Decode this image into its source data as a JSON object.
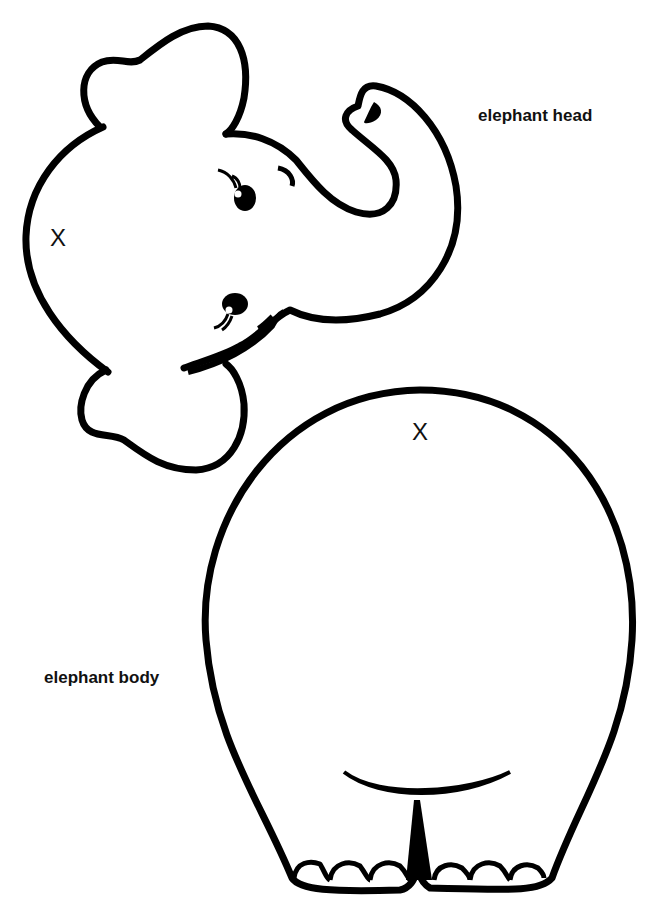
{
  "labels": {
    "head": "elephant head",
    "body": "elephant body"
  },
  "markers": {
    "head_x": "X",
    "body_x": "X"
  },
  "colors": {
    "outline": "#000000",
    "background": "#ffffff"
  },
  "pieces": [
    {
      "name": "elephant head",
      "features": [
        "ears",
        "eyes",
        "trunk",
        "mouth"
      ]
    },
    {
      "name": "elephant body",
      "features": [
        "belly curve",
        "legs",
        "toes"
      ]
    }
  ]
}
